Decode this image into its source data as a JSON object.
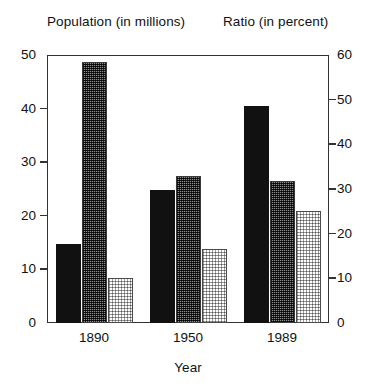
{
  "chart_data": {
    "type": "bar",
    "title": "",
    "left_axis_title": "Population (in millions)",
    "right_axis_title": "Ratio (in percent)",
    "xlabel": "Year",
    "ylabel": "Population (in millions)",
    "y2label": "Ratio (in percent)",
    "categories": [
      "1890",
      "1950",
      "1989"
    ],
    "ylim": [
      0,
      50
    ],
    "y2lim": [
      0,
      60
    ],
    "yticks": [
      "0",
      "10",
      "20",
      "30",
      "40",
      "50"
    ],
    "y2ticks": [
      "0",
      "10",
      "20",
      "30",
      "40",
      "50",
      "60"
    ],
    "grid": false,
    "legend": "none",
    "series": [
      {
        "name": "series-black",
        "fill": "solid-black",
        "axis": "left",
        "values": [
          14.7,
          24.8,
          40.5
        ]
      },
      {
        "name": "series-gray",
        "fill": "dense-gray-hatch",
        "axis": "left",
        "values": [
          48.7,
          27.4,
          26.5
        ]
      },
      {
        "name": "series-light",
        "fill": "light-dotted",
        "axis": "right",
        "values": [
          10.0,
          16.5,
          25.0
        ]
      }
    ]
  },
  "axes": {
    "left_ticks": [
      {
        "label": "50",
        "value": 50
      },
      {
        "label": "40",
        "value": 40
      },
      {
        "label": "30",
        "value": 30
      },
      {
        "label": "20",
        "value": 20
      },
      {
        "label": "10",
        "value": 10
      },
      {
        "label": "0",
        "value": 0
      }
    ],
    "right_ticks": [
      {
        "label": "60",
        "value": 60
      },
      {
        "label": "50",
        "value": 50
      },
      {
        "label": "40",
        "value": 40
      },
      {
        "label": "30",
        "value": 30
      },
      {
        "label": "20",
        "value": 20
      },
      {
        "label": "10",
        "value": 10
      },
      {
        "label": "0",
        "value": 0
      }
    ]
  },
  "colors": {
    "axis": "#333333",
    "text": "#111111",
    "bar_solid": "#111111",
    "bar_mid": "#8e8e8e",
    "bar_light": "#ffffff",
    "background": "#ffffff"
  }
}
